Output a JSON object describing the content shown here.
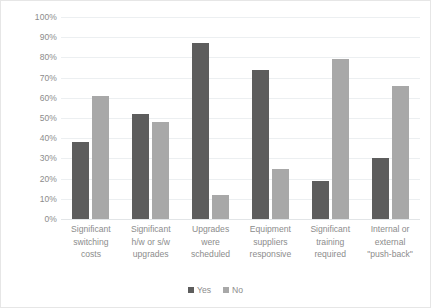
{
  "chart_data": {
    "type": "bar",
    "title": "",
    "subtitle": "",
    "xlabel": "",
    "ylabel": "",
    "ylim": [
      0,
      100
    ],
    "y_tick_labels": [
      "100%",
      "90%",
      "80%",
      "70%",
      "60%",
      "50%",
      "40%",
      "30%",
      "20%",
      "10%",
      "0%"
    ],
    "y_tick_values": [
      100,
      90,
      80,
      70,
      60,
      50,
      40,
      30,
      20,
      10,
      0
    ],
    "grid": "horizontal",
    "legend_position": "bottom-center",
    "categories": [
      "Significant switching costs",
      "Significant h/w or s/w upgrades",
      "Upgrades were scheduled",
      "Equipment suppliers responsive",
      "Significant training required",
      "Internal or external \"push-back\""
    ],
    "category_label_lines": [
      [
        "Significant",
        "switching",
        "costs"
      ],
      [
        "Significant",
        "h/w or s/w",
        "upgrades"
      ],
      [
        "Upgrades",
        "were",
        "scheduled"
      ],
      [
        "Equipment",
        "suppliers",
        "responsive"
      ],
      [
        "Significant",
        "training",
        "required"
      ],
      [
        "Internal or",
        "external",
        "\"push-back\""
      ]
    ],
    "series": [
      {
        "name": "Yes",
        "color": "#5d5d5d",
        "values": [
          38,
          52,
          87,
          74,
          19,
          30
        ]
      },
      {
        "name": "No",
        "color": "#a8a8a8",
        "values": [
          61,
          48,
          12,
          25,
          79,
          66
        ]
      }
    ]
  },
  "legend": {
    "items": [
      {
        "label": "Yes",
        "color": "#5d5d5d"
      },
      {
        "label": "No",
        "color": "#a8a8a8"
      }
    ]
  },
  "colors": {
    "series_yes": "#5d5d5d",
    "series_no": "#a8a8a8",
    "gridline": "#eceff1",
    "axis_text": "#8c8c8c",
    "border": "#e6e6e6",
    "background": "#ffffff"
  }
}
